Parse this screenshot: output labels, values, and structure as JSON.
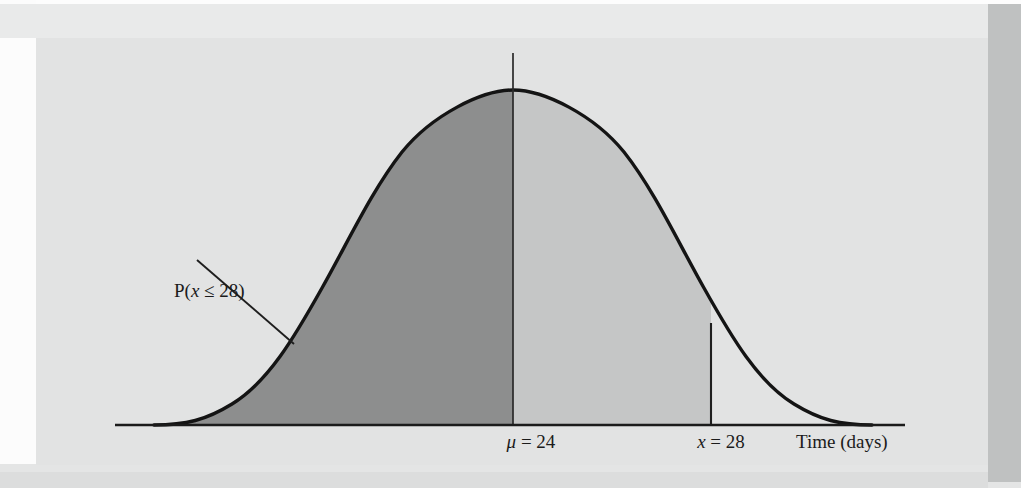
{
  "figure": {
    "kind": "normal-distribution-curve"
  },
  "labels": {
    "probability": "P(x ≤ 28)",
    "probability_parts": {
      "prefix": "P(",
      "variable": "x",
      "relation": " ≤ 28)"
    },
    "mean": {
      "symbol": "μ",
      "equals": " = ",
      "value": "24",
      "full": "μ = 24"
    },
    "xvalue": {
      "symbol": "x",
      "equals": " = ",
      "value": "28",
      "full": "x = 28"
    },
    "axis_title": "Time (days)"
  },
  "colors": {
    "panel_background": "#e2e3e3",
    "page_background": "#fdfdfd",
    "shade_dark": "#8d8e8e",
    "shade_light": "#c5c6c6",
    "curve_stroke": "#141414",
    "axis_stroke": "#1b1b1b",
    "band_top": "#e9eaea",
    "band_right": "#bfc1c1",
    "band_bottom": "#e4e5e5"
  },
  "chart_data": {
    "type": "area",
    "title": "",
    "subtitle": "",
    "xlabel": "Time (days)",
    "ylabel": "",
    "grid": false,
    "legend": null,
    "distribution": "normal",
    "mean": 24,
    "mean_label": "μ = 24",
    "x_marker": 28,
    "x_marker_label": "x = 28",
    "shaded_region": {
      "label": "P(x ≤ 28)",
      "from": "-infinity",
      "to": 28,
      "fill": "#8d8e8e",
      "note": "cumulative left-tail probability up to x = 28"
    },
    "secondary_region": {
      "from": 24,
      "to": 28,
      "fill": "#c5c6c6",
      "note": "lighter shading between the mean and x = 28"
    },
    "annotations": [
      {
        "text": "P(x ≤ 28)",
        "kind": "leader-line-callout",
        "points_to": "left tail shaded area"
      },
      {
        "text": "μ = 24",
        "kind": "axis-tick-label",
        "at_x": 24
      },
      {
        "text": "x = 28",
        "kind": "axis-tick-label",
        "at_x": 28
      },
      {
        "text": "Time (days)",
        "kind": "axis-title"
      }
    ],
    "axis_ticks": [
      "μ = 24",
      "x = 28"
    ],
    "series": [
      {
        "name": "normal density",
        "x": [
          18.0,
          18.6,
          19.2,
          19.8,
          20.4,
          21.0,
          21.6,
          22.2,
          22.8,
          23.4,
          24.0,
          24.6,
          25.2,
          25.8,
          26.4,
          27.0,
          27.6,
          28.0,
          28.6,
          29.2,
          29.8,
          30.4,
          31.0,
          31.6,
          32.0
        ],
        "y": [
          0.04,
          0.07,
          0.11,
          0.18,
          0.27,
          0.39,
          0.53,
          0.68,
          0.82,
          0.94,
          1.0,
          0.94,
          0.82,
          0.68,
          0.53,
          0.39,
          0.27,
          0.21,
          0.14,
          0.09,
          0.06,
          0.04,
          0.02,
          0.01,
          0.01
        ]
      }
    ]
  }
}
